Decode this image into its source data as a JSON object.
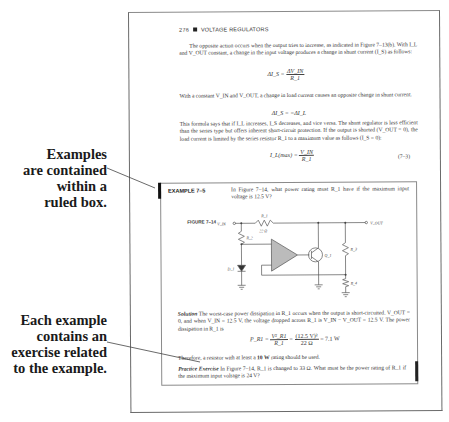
{
  "callouts": [
    {
      "id": "examples-box",
      "lines": [
        "Examples",
        "are contained",
        "within a",
        "ruled box."
      ]
    },
    {
      "id": "exercise",
      "lines": [
        "Each example",
        "contains an",
        "exercise related",
        "to the example."
      ]
    }
  ],
  "page": {
    "header": {
      "page_number": "276",
      "section": "VOLTAGE REGULATORS"
    },
    "paragraphs": [
      "The opposite action occurs when the output tries to increase, as indicated in Figure 7–13(b). With I_L and V_OUT constant, a change in the input voltage produces a change in shunt current (I_S) as follows:",
      "With a constant V_IN and V_OUT, a change in load current causes an opposite change in shunt current.",
      "This formula says that if I_L increases, I_S decreases, and vice versa. The shunt regulator is less efficient than the series type but offers inherent short-circuit protection. If the output is shorted (V_OUT = 0), the load current is limited by the series resistor R_1 to a maximum value as follows (I_S = 0):"
    ],
    "equations": {
      "eq1_lhs": "ΔI_S =",
      "eq1_num": "ΔV_IN",
      "eq1_den": "R_1",
      "eq2": "ΔI_S = −ΔI_L",
      "eq3_lhs": "I_L(max) =",
      "eq3_num": "V_IN",
      "eq3_den": "R_1",
      "eq3_number": "(7–3)"
    },
    "example": {
      "label": "EXAMPLE 7–5",
      "question": "In Figure 7–14, what power rating must R_1 have if the maximum input voltage is 12.5 V?",
      "figure_label": "FIGURE 7–14",
      "circuit": {
        "vin_label": "V_IN",
        "vout_label": "V_OUT",
        "r1_label": "R_1",
        "r1_value": "22 Ω",
        "r2_label": "R_2",
        "r3_label": "R_3",
        "r4_label": "R_4",
        "d1_label": "D_1",
        "q1_label": "Q_1"
      },
      "solution_label": "Solution",
      "solution_text": "The worst-case power dissipation in R_1 occurs when the output is short-circuited. V_OUT = 0, and when V_IN = 12.5 V, the voltage dropped across R_1 is V_IN − V_OUT = 12.5 V. The power dissipation in R_1 is",
      "power_eq": {
        "lhs": "P_R1 =",
        "f1_num": "V²_R1",
        "f1_den": "R_1",
        "eq": "=",
        "f2_num": "(12.5 V)²",
        "f2_den": "22 Ω",
        "result": "= 7.1 W"
      },
      "conclusion_pre": "Therefore, a resistor with at least a ",
      "conclusion_bold": "10 W",
      "conclusion_post": " rating should be used.",
      "practice_label": "Practice Exercise",
      "practice_text": "In Figure 7–14, R_1 is changed to 33 Ω. What must be the power rating of R_1 if the maximum input voltage is 24 V?"
    }
  }
}
